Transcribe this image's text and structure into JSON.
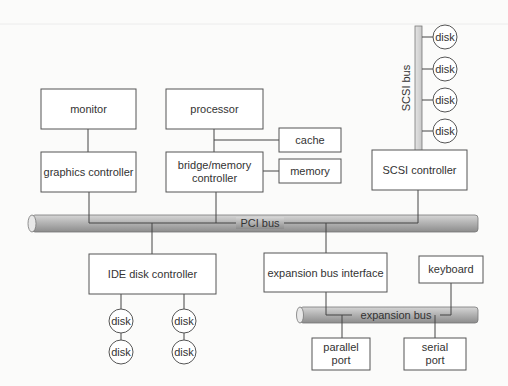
{
  "diagram": {
    "components": {
      "monitor": "monitor",
      "processor": "processor",
      "cache": "cache",
      "graphics_controller": "graphics controller",
      "bridge_line1": "bridge/memory",
      "bridge_line2": "controller",
      "memory": "memory",
      "scsi_controller": "SCSI controller",
      "ide_controller": "IDE disk controller",
      "expansion_interface": "expansion bus interface",
      "keyboard": "keyboard",
      "parallel_line1": "parallel",
      "parallel_line2": "port",
      "serial_line1": "serial",
      "serial_line2": "port"
    },
    "buses": {
      "pci": "PCI bus",
      "scsi": "SCSI bus",
      "expansion": "expansion bus"
    },
    "disk_label": "disk",
    "scsi_disks": [
      "disk",
      "disk",
      "disk",
      "disk"
    ],
    "ide_disks": [
      "disk",
      "disk",
      "disk",
      "disk"
    ],
    "colors": {
      "bus_fill": "#a8a8a8",
      "box_stroke": "#555555",
      "background": "#fbfbfa"
    }
  }
}
